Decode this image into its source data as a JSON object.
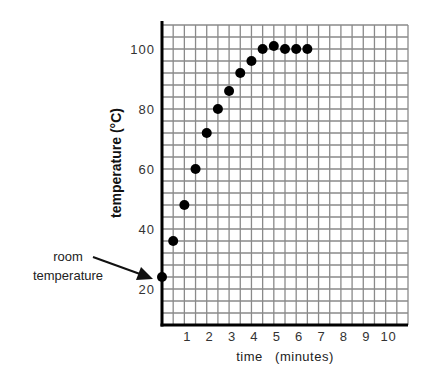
{
  "chart_data": {
    "type": "scatter",
    "title": "",
    "xlabel": "time   (minutes)",
    "ylabel": "temperature (°C)",
    "xlim": [
      0,
      11
    ],
    "ylim": [
      8,
      108
    ],
    "x_grid_step": 0.5,
    "y_grid_step": 4,
    "grid": true,
    "x_ticks": [
      1,
      2,
      3,
      4,
      5,
      6,
      7,
      8,
      9,
      10
    ],
    "x_tick_labels": [
      "1",
      "2",
      "3",
      "4",
      "5",
      "6",
      "7",
      "8",
      "9",
      "10"
    ],
    "y_ticks": [
      20,
      40,
      60,
      80,
      100
    ],
    "y_tick_labels": [
      "20",
      "40",
      "60",
      "80",
      "100"
    ],
    "series": [
      {
        "name": "water temperature",
        "color": "#000000",
        "x": [
          0,
          0.5,
          1,
          1.5,
          2,
          2.5,
          3,
          3.5,
          4,
          4.5,
          5,
          5.5,
          6,
          6.5
        ],
        "y": [
          24,
          36,
          48,
          60,
          72,
          80,
          86,
          92,
          96,
          100,
          101,
          100,
          100,
          100
        ]
      }
    ],
    "annotations": [
      {
        "text_lines": [
          "room",
          "temperature"
        ],
        "points_to": {
          "x": 0,
          "y": 24
        },
        "type": "arrow"
      }
    ]
  },
  "colors": {
    "grid": "#8a8a8a",
    "axis": "#000000",
    "marker": "#000000"
  }
}
